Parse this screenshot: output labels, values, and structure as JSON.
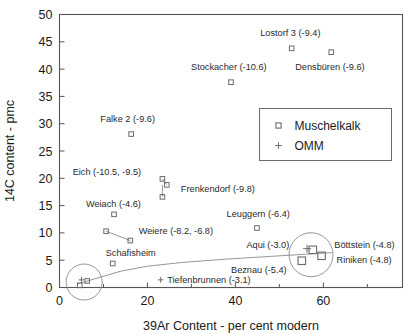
{
  "chart_data": {
    "type": "scatter",
    "title": "",
    "xlabel": "39Ar Content - per cent modern",
    "ylabel": "14C content - pmc",
    "xlim": [
      0,
      78
    ],
    "ylim": [
      0,
      50
    ],
    "xticks": [
      0,
      20,
      40,
      60
    ],
    "xticks_minor": [
      10,
      30,
      50,
      70
    ],
    "yticks": [
      0,
      5,
      10,
      15,
      20,
      25,
      30,
      35,
      40,
      45,
      50
    ],
    "grid": false,
    "legend_position": "upper-right-inset",
    "series": [
      {
        "name": "Muschelkalk",
        "marker": "square",
        "points": [
          {
            "label": "Lostorf 3 (-9.4)",
            "x": 52.8,
            "y": 43.8
          },
          {
            "label": "Densbüren (-9.6)",
            "x": 61.8,
            "y": 43.1
          },
          {
            "label": "Stockacher (-10.6)",
            "x": 39.0,
            "y": 37.6
          },
          {
            "label": "Falke 2 (-9.6)",
            "x": 16.3,
            "y": 28.1
          },
          {
            "label": "Eich (-10.5)",
            "x": 23.4,
            "y": 19.9
          },
          {
            "label": "Frenkendorf (-9.8)",
            "x": 24.4,
            "y": 18.8
          },
          {
            "label": "Eich (-9.5)",
            "x": 23.4,
            "y": 16.6
          },
          {
            "label": "Weiach (-4.6)",
            "x": 12.4,
            "y": 13.4
          },
          {
            "label": "Leuggern (-6.4)",
            "x": 44.9,
            "y": 10.9
          },
          {
            "label": "Weiere (-8.2)",
            "x": 10.6,
            "y": 10.3
          },
          {
            "label": "Weiere (-6.8)",
            "x": 16.1,
            "y": 8.6
          },
          {
            "label": "Böttstein (-4.8)",
            "x": 57.6,
            "y": 6.9
          },
          {
            "label": "Riniken (-4.8)",
            "x": 59.6,
            "y": 5.8
          },
          {
            "label": "Beznau (-5.4)",
            "x": 55.1,
            "y": 4.9
          },
          {
            "label": "Schafisheim",
            "x": 12.1,
            "y": 4.4
          },
          {
            "label": "",
            "x": 6.3,
            "y": 1.2
          },
          {
            "label": "",
            "x": 4.6,
            "y": 0.4
          }
        ]
      },
      {
        "name": "OMM",
        "marker": "plus",
        "points": [
          {
            "label": "Aqui (-3.0)",
            "x": 56.3,
            "y": 7.1
          },
          {
            "label": "Tiefenbrunnen (-3.1)",
            "x": 23.0,
            "y": 1.4
          },
          {
            "label": "",
            "x": 5.0,
            "y": 1.4
          }
        ]
      }
    ],
    "annotations": [
      {
        "text": "Lostorf 3 (-9.4)",
        "x": 52.5,
        "y": 46.7,
        "anchor": "middle"
      },
      {
        "text": "Densbüren (-9.6)",
        "x": 61.5,
        "y": 40.4,
        "anchor": "middle"
      },
      {
        "text": "Stockacher (-10.6)",
        "x": 38.5,
        "y": 40.4,
        "anchor": "middle"
      },
      {
        "text": "Falke 2 (-9.6)",
        "x": 15.5,
        "y": 30.9,
        "anchor": "middle"
      },
      {
        "text": "Eich (-10.5, -9.5)",
        "x": 3.0,
        "y": 21.2,
        "anchor": "start"
      },
      {
        "text": "Frenkendorf (-9.8)",
        "x": 27.6,
        "y": 18.1,
        "anchor": "start"
      },
      {
        "text": "Weiach (-4.6)",
        "x": 6.0,
        "y": 15.4,
        "anchor": "start"
      },
      {
        "text": "Leuggern (-6.4)",
        "x": 38.0,
        "y": 13.5,
        "anchor": "start"
      },
      {
        "text": "Weiere (-8.2, -6.8)",
        "x": 18.0,
        "y": 10.4,
        "anchor": "start"
      },
      {
        "text": "Aqui (-3.0)",
        "x": 42.5,
        "y": 7.9,
        "anchor": "start"
      },
      {
        "text": "Böttstein (-4.8)",
        "x": 62.5,
        "y": 7.9,
        "anchor": "start"
      },
      {
        "text": "Schafisheim",
        "x": 10.5,
        "y": 6.3,
        "anchor": "start"
      },
      {
        "text": "Riniken (-4.8)",
        "x": 63.0,
        "y": 5.0,
        "anchor": "start"
      },
      {
        "text": "Beznau (-5.4)",
        "x": 39.0,
        "y": 3.2,
        "anchor": "start"
      },
      {
        "text": "Tiefenbrunnen (-3.1)",
        "x": 24.5,
        "y": 1.4,
        "anchor": "start"
      }
    ],
    "legend_entries": [
      {
        "label": "Muschelkalk",
        "marker": "square"
      },
      {
        "label": "OMM",
        "marker": "plus"
      }
    ],
    "highlight_circles": [
      {
        "cx": 5.6,
        "cy": 1.0,
        "r_px": 18
      },
      {
        "cx": 57.2,
        "cy": 6.0,
        "r_px": 22
      }
    ],
    "trend_curve": {
      "comment": "envelope curve through low-14C mixing points",
      "points": [
        [
          4.0,
          0.6
        ],
        [
          8.0,
          1.6
        ],
        [
          14.0,
          3.0
        ],
        [
          20.0,
          3.9
        ],
        [
          28.0,
          4.6
        ],
        [
          38.0,
          5.2
        ],
        [
          48.0,
          5.7
        ],
        [
          56.0,
          6.1
        ],
        [
          62.0,
          6.4
        ]
      ]
    },
    "leader_lines": [
      {
        "from": [
          23.4,
          19.9
        ],
        "to": [
          24.4,
          18.8
        ]
      },
      {
        "from": [
          23.4,
          18.8
        ],
        "to": [
          23.4,
          16.6
        ]
      },
      {
        "from": [
          10.6,
          10.3
        ],
        "to": [
          16.1,
          8.6
        ]
      }
    ],
    "colors": {
      "axis": "#555555",
      "marker": "#6b6b6b",
      "text": "#1a1a1a",
      "background": "#ffffff"
    }
  }
}
